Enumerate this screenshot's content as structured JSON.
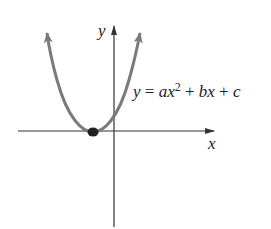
{
  "diagram": {
    "type": "parabola-graph",
    "equation": {
      "lhs": "y",
      "eq": " = ",
      "a": "a",
      "x1": "x",
      "exp": "2",
      "plus1": " + ",
      "b": "b",
      "x2": "x",
      "plus2": " + ",
      "c": "c"
    },
    "axes": {
      "x_label": "x",
      "y_label": "y"
    },
    "vertex_point": "vertex on x-axis (single root)",
    "colors": {
      "curve": "#7a7a7a",
      "axes": "#333333",
      "point": "#222222"
    }
  }
}
